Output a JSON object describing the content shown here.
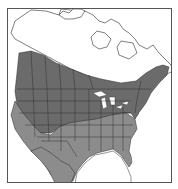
{
  "map": {
    "title": "",
    "region": "North America",
    "type": "species range map",
    "colors": {
      "background": "#ffffff",
      "land": "#ffffff",
      "range_primary": "#6b6b6b",
      "range_secondary": "#8c8c8c",
      "borders": "#2a2a2a",
      "frame": "#555555"
    },
    "legend": []
  }
}
